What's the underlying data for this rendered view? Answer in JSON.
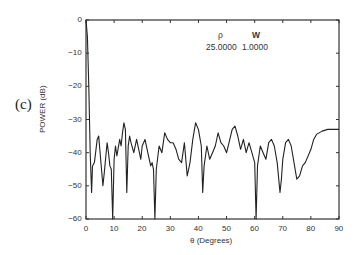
{
  "panel_label": "(c)",
  "legend": {
    "headers": [
      "ρ",
      "W"
    ],
    "values": [
      "25.0000",
      "1.0000"
    ]
  },
  "chart_data": {
    "type": "line",
    "title": "",
    "xlabel": "θ (Degrees)",
    "ylabel": "POWER (dB)",
    "xlim": [
      0,
      90
    ],
    "ylim": [
      -60,
      0
    ],
    "xticks": [
      0,
      10,
      20,
      30,
      40,
      50,
      60,
      70,
      80,
      90
    ],
    "yticks": [
      0,
      -10,
      -20,
      -30,
      -40,
      -50,
      -60
    ],
    "grid": false,
    "legend_position": "top-right (inside)",
    "annotations": [
      {
        "label": "ρ",
        "value": "25.0000"
      },
      {
        "label": "W",
        "value": "1.0000"
      }
    ],
    "series": [
      {
        "name": "power",
        "x": [
          0,
          0.5,
          1,
          1.5,
          2,
          2.3,
          3,
          4,
          4.5,
          5,
          6,
          6.5,
          7.5,
          8,
          8.5,
          9,
          9.5,
          10,
          10.5,
          11,
          12,
          12.5,
          13,
          13.5,
          14,
          14.5,
          15,
          15.5,
          16,
          17,
          18,
          19,
          19.5,
          20,
          21,
          22,
          23,
          23.5,
          24,
          24.5,
          25,
          26,
          27,
          28,
          29,
          30,
          31,
          32,
          33,
          34,
          35,
          36,
          36.5,
          37,
          38,
          39,
          40,
          41,
          41.5,
          42,
          43,
          44,
          45,
          46,
          47,
          48,
          49,
          50,
          52,
          53,
          54,
          55,
          56,
          57,
          58,
          59,
          60,
          60.5,
          61,
          62,
          63,
          64,
          65,
          66,
          67,
          68,
          69,
          69.5,
          70,
          71,
          72,
          73,
          74,
          75,
          76,
          77,
          78,
          80,
          81,
          82,
          84,
          86,
          90
        ],
        "y": [
          0,
          -5,
          -20,
          -40,
          -52,
          -44,
          -43,
          -36,
          -35,
          -40,
          -50,
          -46,
          -37,
          -40,
          -44,
          -45,
          -60,
          -42,
          -38,
          -41,
          -36,
          -38,
          -34,
          -31,
          -33,
          -52,
          -38,
          -35,
          -37,
          -40,
          -36,
          -40,
          -42,
          -38,
          -36,
          -40,
          -44,
          -43,
          -45,
          -60,
          -45,
          -38,
          -40,
          -34,
          -36,
          -37,
          -37,
          -39,
          -42,
          -43,
          -37,
          -47,
          -45,
          -43,
          -36,
          -31,
          -33,
          -38,
          -52,
          -44,
          -38,
          -42,
          -40,
          -38,
          -34,
          -37,
          -38,
          -40,
          -33,
          -32,
          -35,
          -39,
          -36,
          -40,
          -37,
          -40,
          -43,
          -60,
          -44,
          -38,
          -40,
          -42,
          -37,
          -36,
          -38,
          -43,
          -52,
          -48,
          -42,
          -37,
          -36,
          -38,
          -43,
          -48,
          -47,
          -44,
          -43,
          -39,
          -36,
          -34.5,
          -33.5,
          -33,
          -33
        ]
      }
    ]
  }
}
